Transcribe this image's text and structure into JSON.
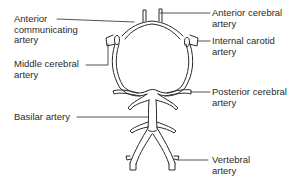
{
  "diagram": {
    "colors": {
      "line": "#2a2a2a",
      "background": "#ffffff"
    },
    "labels": {
      "anterior_communicating": {
        "line1": "Anterior",
        "line2": "communicating",
        "line3": "artery"
      },
      "middle_cerebral": {
        "line1": "Middle cerebral",
        "line2": "artery"
      },
      "basilar": {
        "line1": "Basilar artery"
      },
      "anterior_cerebral": {
        "line1": "Anterior cerebral",
        "line2": "artery"
      },
      "internal_carotid": {
        "line1": "Internal carotid",
        "line2": "artery"
      },
      "posterior_cerebral": {
        "line1": "Posterior cerebral",
        "line2": "artery"
      },
      "vertebral": {
        "line1": "Vertebral",
        "line2": "artery"
      }
    }
  }
}
